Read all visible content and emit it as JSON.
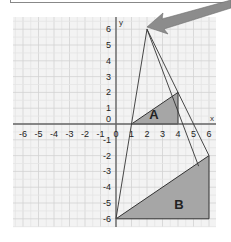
{
  "diagram": {
    "type": "enlargement",
    "axes": {
      "x_label": "x",
      "y_label": "y",
      "x_range": [
        -6,
        6
      ],
      "y_range": [
        -6,
        6
      ],
      "x_ticks": [
        "-6",
        "-5",
        "-4",
        "-3",
        "-2",
        "-1",
        "0",
        "1",
        "2",
        "3",
        "4",
        "5",
        "6"
      ],
      "y_ticks": [
        "6",
        "5",
        "4",
        "3",
        "2",
        "1",
        "0",
        "-1",
        "-2",
        "-3",
        "-4",
        "-5",
        "-6"
      ],
      "grid": true
    },
    "shapes": [
      {
        "label": "A",
        "vertices": [
          [
            1,
            0
          ],
          [
            4,
            2
          ],
          [
            4,
            0
          ]
        ],
        "fill": "#a6a6a6"
      },
      {
        "label": "B",
        "vertices": [
          [
            0,
            -6
          ],
          [
            6,
            -2
          ],
          [
            6,
            -6
          ]
        ],
        "fill": "#a6a6a6"
      }
    ],
    "centre_of_enlargement": [
      2,
      6
    ],
    "rays": [
      {
        "from": [
          2,
          6
        ],
        "to": [
          0,
          -6
        ]
      },
      {
        "from": [
          2,
          6
        ],
        "to": [
          6,
          -2
        ]
      },
      {
        "from": [
          2,
          6
        ],
        "to": [
          5.33,
          -2.67
        ]
      }
    ],
    "arrow": {
      "points_to": [
        2,
        6
      ],
      "color": "#8c8c8c"
    }
  },
  "labels": {
    "shape_a": "A",
    "shape_b": "B",
    "x_axis": "x",
    "y_axis": "y"
  }
}
